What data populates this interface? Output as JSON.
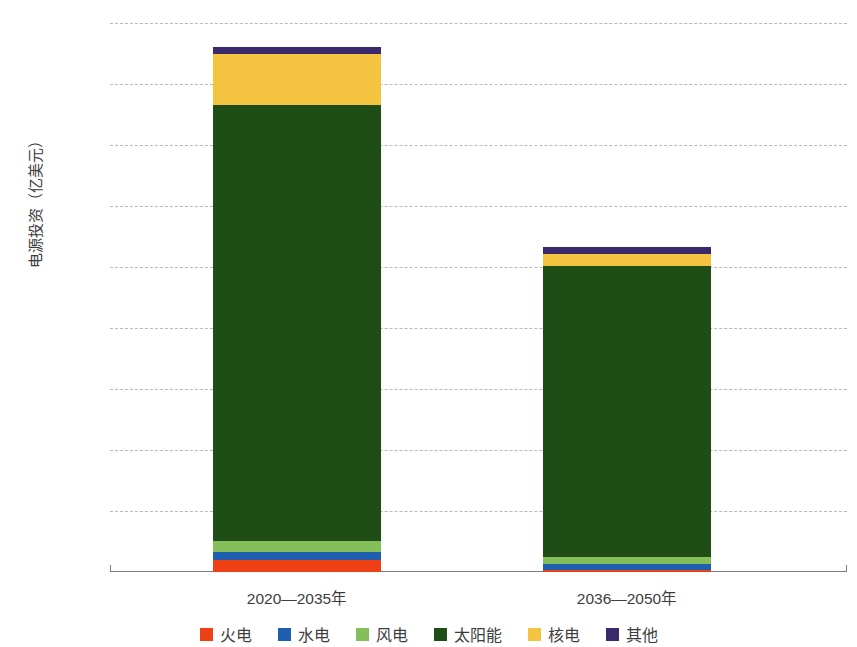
{
  "chart_data": {
    "type": "bar",
    "stacked": true,
    "title": "",
    "subtitle": "",
    "xlabel": "",
    "ylabel": "电源投资（亿美元）",
    "categories": [
      "2020—2035年",
      "2036—2050年"
    ],
    "ylim": [
      0,
      18000
    ],
    "yticks": [
      0,
      2000,
      4000,
      6000,
      8000,
      10000,
      12000,
      14000,
      16000,
      18000
    ],
    "ytick_labels": [
      "0",
      "2000",
      "4000",
      "6000",
      "8000",
      "10000",
      "12000",
      "14000",
      "16000",
      "18000"
    ],
    "grid": "horizontal-dashed",
    "legend_position": "bottom",
    "series": [
      {
        "name": "火电",
        "color": "#EE4014",
        "values": [
          400,
          80
        ]
      },
      {
        "name": "水电",
        "color": "#1F5FAF",
        "values": [
          270,
          170
        ]
      },
      {
        "name": "风电",
        "color": "#84BF5B",
        "values": [
          350,
          230
        ]
      },
      {
        "name": "太阳能",
        "color": "#1F4D16",
        "values": [
          14280,
          9540
        ]
      },
      {
        "name": "核电",
        "color": "#F4C33F",
        "values": [
          1700,
          420
        ]
      },
      {
        "name": "其他",
        "color": "#3B2A6B",
        "values": [
          200,
          200
        ]
      }
    ],
    "totals": [
      17200,
      10640
    ]
  },
  "axis": {
    "y_title": "电源投资（亿美元）"
  }
}
